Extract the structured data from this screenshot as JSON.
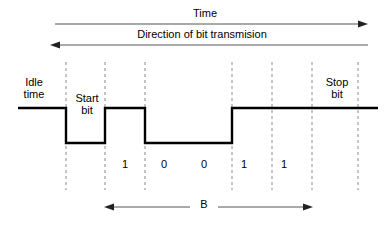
{
  "diagram": {
    "title_label": "Time",
    "direction_label": "Direction of bit transmision",
    "idle_label": "Idle\ntime",
    "start_label": "Start\nbit",
    "stop_label": "Stop\nbit",
    "span_label": "B",
    "bits": [
      {
        "value": "1",
        "x": 125
      },
      {
        "value": "0",
        "x": 164
      },
      {
        "value": "0",
        "x": 204
      },
      {
        "value": "1",
        "x": 244
      },
      {
        "value": "1",
        "x": 284
      }
    ],
    "colors": {
      "signal": "#000000",
      "guide": "#8a8a8a",
      "arrow": "#555555",
      "background": "#ffffff"
    },
    "levels": {
      "high_y": 108,
      "low_y": 143
    },
    "boundaries": [
      66,
      105,
      145,
      232,
      272,
      312,
      358
    ]
  },
  "chart_data": {
    "type": "line",
    "xlabel": "Time",
    "ylabel": "Signal level",
    "categories": [
      "Idle time",
      "Start bit",
      "1",
      "0",
      "0",
      "1",
      "1",
      "Stop bit"
    ],
    "values": [
      1,
      0,
      1,
      0,
      0,
      1,
      1,
      1
    ],
    "ylim": [
      0,
      1
    ],
    "grid": false,
    "legend": "none",
    "annotations": [
      "Time",
      "Direction of bit transmision",
      "B"
    ],
    "data_bits": [
      "1",
      "0",
      "0",
      "1",
      "1"
    ]
  }
}
